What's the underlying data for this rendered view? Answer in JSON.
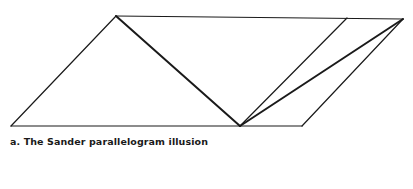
{
  "figure": {
    "caption": "a. The Sander parallelogram illusion",
    "stroke_color": "#1a1a1a",
    "points": {
      "top_left_apex": [
        116,
        16
      ],
      "top_inner": [
        347,
        18
      ],
      "top_right": [
        403,
        19
      ],
      "bottom_left": [
        11,
        126
      ],
      "bottom_mid": [
        240,
        126
      ],
      "bottom_right": [
        302,
        126
      ]
    },
    "segments": [
      {
        "name": "outer-parallelogram-top",
        "from": "top_left_apex",
        "to": "top_right",
        "width": 1.2
      },
      {
        "name": "outer-parallelogram-bottom",
        "from": "bottom_left",
        "to": "bottom_right",
        "width": 1.2
      },
      {
        "name": "left-side",
        "from": "bottom_left",
        "to": "top_left_apex",
        "width": 1.2
      },
      {
        "name": "right-side",
        "from": "bottom_right",
        "to": "top_right",
        "width": 1.2
      },
      {
        "name": "inner-parallelogram-right-side",
        "from": "bottom_mid",
        "to": "top_inner",
        "width": 1.2
      },
      {
        "name": "left-diagonal",
        "from": "top_left_apex",
        "to": "bottom_mid",
        "width": 2
      },
      {
        "name": "right-diagonal",
        "from": "bottom_mid",
        "to": "top_right",
        "width": 2
      }
    ]
  }
}
